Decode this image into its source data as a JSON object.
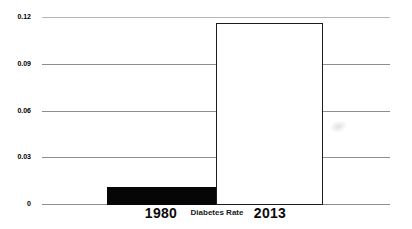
{
  "chart_data": {
    "type": "bar",
    "title": "",
    "xlabel": "Diabetes Rate",
    "ylabel": "",
    "categories": [
      "1980",
      "2013"
    ],
    "values": [
      0.011,
      0.116
    ],
    "ylim": [
      0,
      0.12
    ],
    "yticks": [
      0,
      0.03,
      0.06,
      0.09,
      0.12
    ],
    "ytick_labels": [
      "0",
      "0.03",
      "0.06",
      "0.09",
      "0.12"
    ],
    "grid": true,
    "legend_position": "none",
    "colors": {
      "bar_1980_fill": "#060606",
      "bar_1980_border": "#060606",
      "bar_2013_fill": "#ffffff",
      "bar_2013_border": "#1c1c1c",
      "gridline": "#8e8e8e",
      "gridline_top": "#b5b5b5",
      "text": "#000000",
      "background": "#ffffff"
    }
  }
}
